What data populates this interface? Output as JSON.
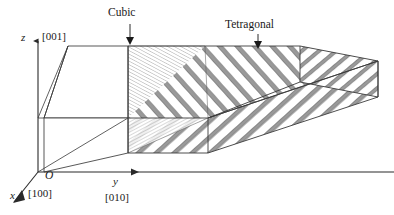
{
  "figure": {
    "title_cubic": "Cubic",
    "title_tetragonal": "Tetragonal",
    "axes": {
      "z_symbol": "z",
      "z_index": "[001]",
      "x_symbol": "x",
      "x_index": "[100]",
      "y_symbol": "y",
      "y_index": "[010]",
      "origin": "O"
    },
    "colors": {
      "outline": "#3a3a3a",
      "hatch": "#8c8c8c",
      "background": "#ffffff",
      "text": "#1a1a1a"
    },
    "regions": [
      {
        "name": "cubic-block",
        "label": "Cubic",
        "hatched": false
      },
      {
        "name": "transition-zone",
        "label": "",
        "hatched": true
      },
      {
        "name": "tetragonal-slab",
        "label": "Tetragonal",
        "hatched": true
      }
    ]
  }
}
